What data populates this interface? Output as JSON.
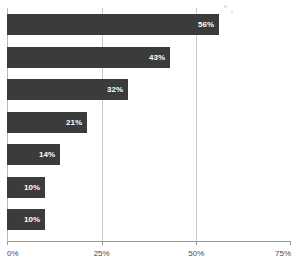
{
  "chart_data": {
    "type": "bar",
    "orientation": "horizontal",
    "title": "",
    "subtitle": "",
    "xlabel": "",
    "ylabel": "",
    "categories": [
      "",
      "",
      "",
      "",
      "",
      "",
      ""
    ],
    "values": [
      56,
      43,
      32,
      21,
      14,
      10,
      10
    ],
    "value_labels": [
      "56%",
      "43%",
      "32%",
      "21%",
      "14%",
      "10%",
      "10%"
    ],
    "xlim": [
      0,
      75
    ],
    "xticks": [
      0,
      25,
      50,
      75
    ],
    "xtick_labels": [
      "0%",
      "25%",
      "50%",
      "75%"
    ],
    "gridlines": [
      25,
      50
    ],
    "grid": true,
    "legend": null,
    "legend_position": "none",
    "bar_color": "#3b3b3b",
    "label_color": "#ffffff",
    "axis_color": "#9a9a9a",
    "gridline_color": "#c9c9c9",
    "background_color": "#ffffff"
  }
}
